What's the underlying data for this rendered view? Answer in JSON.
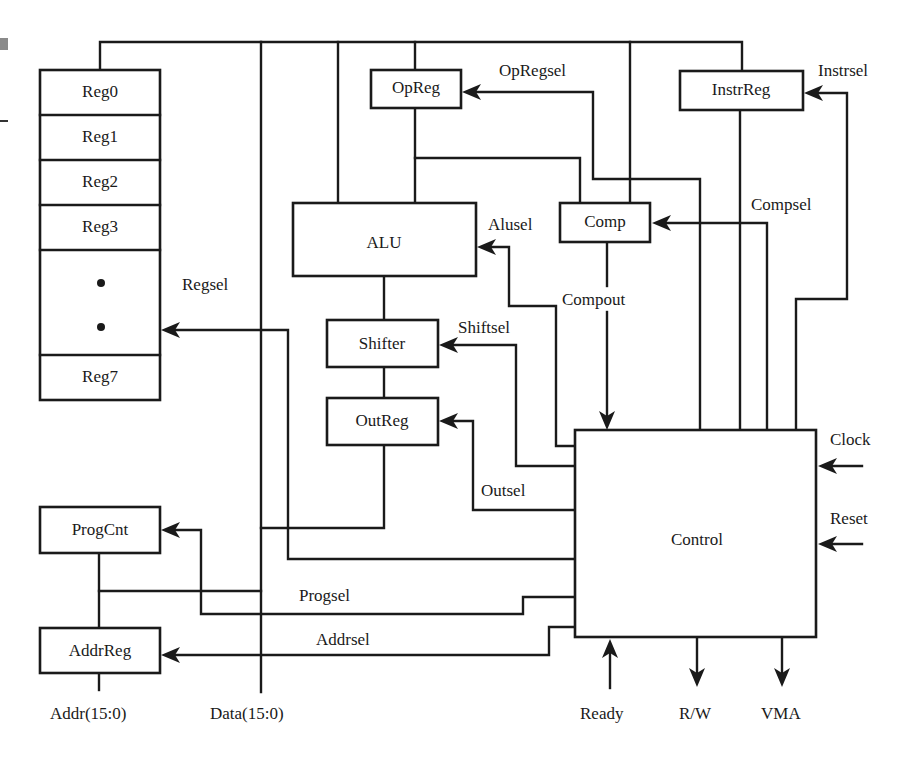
{
  "diagram": {
    "colors": {
      "stroke": "#1a1a1a",
      "background": "#ffffff"
    },
    "blocks": {
      "reg0": "Reg0",
      "reg1": "Reg1",
      "reg2": "Reg2",
      "reg3": "Reg3",
      "reg7": "Reg7",
      "opreg": "OpReg",
      "instrreg": "InstrReg",
      "alu": "ALU",
      "comp": "Comp",
      "shifter": "Shifter",
      "outreg": "OutReg",
      "progcnt": "ProgCnt",
      "addrreg": "AddrReg",
      "control": "Control"
    },
    "signals": {
      "opregsel": "OpRegsel",
      "instrsel": "Instrsel",
      "alusel": "Alusel",
      "compsel": "Compsel",
      "regsel": "Regsel",
      "compout": "Compout",
      "shiftsel": "Shiftsel",
      "outsel": "Outsel",
      "progsel": "Progsel",
      "addrsel": "Addrsel",
      "clock": "Clock",
      "reset": "Reset",
      "ready": "Ready",
      "rw": "R/W",
      "vma": "VMA"
    },
    "buses": {
      "addr": "Addr(15:0)",
      "data": "Data(15:0)"
    }
  }
}
